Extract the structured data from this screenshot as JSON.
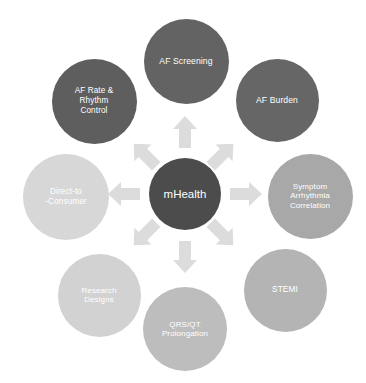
{
  "diagram": {
    "type": "radial-hub-and-spoke",
    "hub": {
      "label": "mHealth",
      "color": "#4c4c4c",
      "diameter": 72,
      "center_x": 185,
      "center_y": 194,
      "font_size": 11.5
    },
    "arrow_color": "#dcdcdc",
    "background_color": "#ffffff",
    "label_color": "#ffffff",
    "nodes": [
      {
        "id": "af-screening",
        "label": "AF Screening",
        "color": "#636363",
        "diameter": 85,
        "center_x": 186,
        "center_y": 61,
        "angle": 90,
        "font_size": 8.6
      },
      {
        "id": "af-burden",
        "label": "AF Burden",
        "color": "#666666",
        "diameter": 83,
        "center_x": 277,
        "center_y": 100,
        "angle": 45,
        "font_size": 8.6
      },
      {
        "id": "symptom-arrhythmia-correlation",
        "label": "Symptom\nArrhythmia\nCorrelation",
        "color": "#a8a8a8",
        "diameter": 85,
        "center_x": 310,
        "center_y": 196,
        "angle": 0,
        "font_size": 8.0
      },
      {
        "id": "stemi",
        "label": "STEMI",
        "color": "#b4b4b4",
        "diameter": 83,
        "center_x": 285,
        "center_y": 290,
        "angle": -45,
        "font_size": 8.4
      },
      {
        "id": "qrs-qt-prolongation",
        "label": "QRS/QT\nProlongation",
        "color": "#bdbdbd",
        "diameter": 84,
        "center_x": 185,
        "center_y": 329,
        "angle": -90,
        "font_size": 8.0
      },
      {
        "id": "research-designs",
        "label": "Research\nDesigns",
        "color": "#d2d2d2",
        "diameter": 83,
        "center_x": 99,
        "center_y": 295,
        "angle": -135,
        "font_size": 8.0
      },
      {
        "id": "direct-to-consumer",
        "label": "Direct-to\n-Consumer",
        "color": "#d7d7d7",
        "diameter": 86,
        "center_x": 66,
        "center_y": 197,
        "angle": 180,
        "font_size": 8.2
      },
      {
        "id": "af-rate-rhythm-control",
        "label": "AF Rate &\nRhythm\nControl",
        "color": "#5e5e5e",
        "diameter": 85,
        "center_x": 94,
        "center_y": 101,
        "angle": 135,
        "font_size": 8.2
      }
    ],
    "arrows": [
      {
        "id": "arrow-up",
        "direction": "up",
        "rotation": 0,
        "center_x": 185,
        "center_y": 132
      },
      {
        "id": "arrow-up-right",
        "direction": "up-right",
        "rotation": 45,
        "center_x": 222,
        "center_y": 155
      },
      {
        "id": "arrow-right",
        "direction": "right",
        "rotation": 90,
        "center_x": 246,
        "center_y": 194
      },
      {
        "id": "arrow-down-right",
        "direction": "down-right",
        "rotation": 135,
        "center_x": 222,
        "center_y": 234
      },
      {
        "id": "arrow-down",
        "direction": "down",
        "rotation": 180,
        "center_x": 185,
        "center_y": 257
      },
      {
        "id": "arrow-down-left",
        "direction": "down-left",
        "rotation": 225,
        "center_x": 145,
        "center_y": 234
      },
      {
        "id": "arrow-left",
        "direction": "left",
        "rotation": 270,
        "center_x": 124,
        "center_y": 194
      },
      {
        "id": "arrow-up-left",
        "direction": "up-left",
        "rotation": 315,
        "center_x": 145,
        "center_y": 155
      }
    ]
  }
}
